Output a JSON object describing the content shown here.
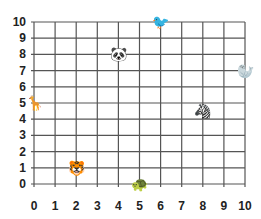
{
  "grid": {
    "x_min": 0,
    "x_max": 10,
    "y_min": 0,
    "y_max": 10,
    "origin_px": [
      34,
      184
    ],
    "unit_px": [
      21.1,
      16.2
    ],
    "line_color": "#555555"
  },
  "x_ticks": [
    "0",
    "1",
    "2",
    "3",
    "4",
    "5",
    "6",
    "7",
    "8",
    "9",
    "10"
  ],
  "y_ticks": [
    "0",
    "1",
    "2",
    "3",
    "4",
    "5",
    "6",
    "7",
    "8",
    "9",
    "10"
  ],
  "animals": [
    {
      "name": "panda",
      "glyph": "🐼",
      "x": 4,
      "y": 8
    },
    {
      "name": "bird",
      "glyph": "🐦",
      "x": 6,
      "y": 10
    },
    {
      "name": "seal",
      "glyph": "🦭",
      "x": 10,
      "y": 7
    },
    {
      "name": "giraffe",
      "glyph": "🦒",
      "x": 0,
      "y": 5
    },
    {
      "name": "zebra",
      "glyph": "🦓",
      "x": 8,
      "y": 4.5
    },
    {
      "name": "tiger",
      "glyph": "🐯",
      "x": 2,
      "y": 1
    },
    {
      "name": "turtle",
      "glyph": "🐢",
      "x": 5,
      "y": 0
    }
  ],
  "chart_data": {
    "type": "scatter",
    "title": "",
    "xlabel": "",
    "ylabel": "",
    "xlim": [
      0,
      10
    ],
    "ylim": [
      0,
      10
    ],
    "grid": true,
    "points": [
      {
        "label": "panda",
        "x": 4,
        "y": 8
      },
      {
        "label": "bird",
        "x": 6,
        "y": 10
      },
      {
        "label": "seal",
        "x": 10,
        "y": 7
      },
      {
        "label": "giraffe",
        "x": 0,
        "y": 5
      },
      {
        "label": "zebra",
        "x": 8,
        "y": 4.5
      },
      {
        "label": "tiger",
        "x": 2,
        "y": 1
      },
      {
        "label": "turtle",
        "x": 5,
        "y": 0
      }
    ]
  }
}
